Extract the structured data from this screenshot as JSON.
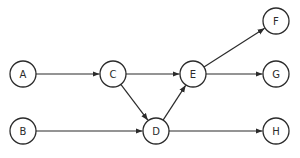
{
  "diagram": {
    "type": "directed-graph",
    "colors": {
      "stroke": "#2b2b2b",
      "fill": "#ffffff",
      "background": "#ffffff"
    },
    "node_radius": 13,
    "nodes": [
      {
        "id": "A",
        "label": "A",
        "x": 23,
        "y": 74
      },
      {
        "id": "B",
        "label": "B",
        "x": 23,
        "y": 131
      },
      {
        "id": "C",
        "label": "C",
        "x": 113,
        "y": 74
      },
      {
        "id": "D",
        "label": "D",
        "x": 156,
        "y": 131
      },
      {
        "id": "E",
        "label": "E",
        "x": 193,
        "y": 74
      },
      {
        "id": "F",
        "label": "F",
        "x": 276,
        "y": 21
      },
      {
        "id": "G",
        "label": "G",
        "x": 276,
        "y": 74
      },
      {
        "id": "H",
        "label": "H",
        "x": 276,
        "y": 131
      }
    ],
    "edges": [
      {
        "from": "A",
        "to": "C"
      },
      {
        "from": "C",
        "to": "E"
      },
      {
        "from": "C",
        "to": "D"
      },
      {
        "from": "B",
        "to": "D"
      },
      {
        "from": "D",
        "to": "E"
      },
      {
        "from": "E",
        "to": "F"
      },
      {
        "from": "E",
        "to": "G"
      },
      {
        "from": "D",
        "to": "H"
      }
    ]
  }
}
